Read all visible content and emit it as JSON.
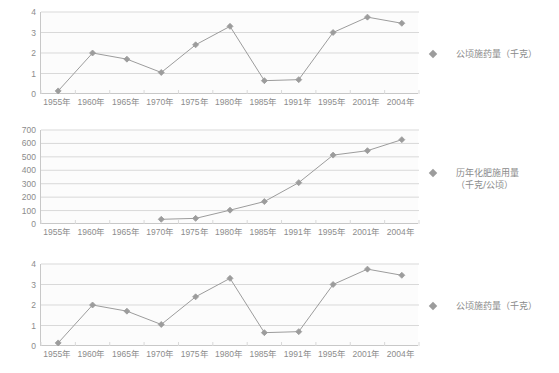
{
  "page": {
    "background": "#ffffff",
    "series_color": "#9c9c9c",
    "grid_color": "#d9d9d9",
    "axis_color": "#c8c8c8",
    "text_color": "#8c8c8c"
  },
  "charts": [
    {
      "id": "chart-top",
      "legend": {
        "label": "公顷施药量（千克）",
        "marker": "diamond-marker"
      },
      "chart_data": {
        "type": "line",
        "title": "",
        "xlabel": "",
        "ylabel": "",
        "categories": [
          "1955年",
          "1960年",
          "1965年",
          "1970年",
          "1975年",
          "1980年",
          "1985年",
          "1991年",
          "1995年",
          "2001年",
          "2004年"
        ],
        "values": [
          0.15,
          2.0,
          1.7,
          1.05,
          2.4,
          3.3,
          0.65,
          0.7,
          3.0,
          3.75,
          3.45
        ],
        "ylim": [
          0,
          4
        ],
        "yticks": [
          0,
          1,
          2,
          3,
          4
        ],
        "grid": true,
        "legend_position": "right",
        "series": [
          {
            "name": "公顷施药量（千克）",
            "values": [
              0.15,
              2.0,
              1.7,
              1.05,
              2.4,
              3.3,
              0.65,
              0.7,
              3.0,
              3.75,
              3.45
            ]
          }
        ]
      }
    },
    {
      "id": "chart-middle",
      "legend": {
        "label": "历年化肥施用量\n（千克/公顷）",
        "marker": "diamond-marker"
      },
      "chart_data": {
        "type": "line",
        "title": "",
        "xlabel": "",
        "ylabel": "",
        "categories": [
          "1955年",
          "1960年",
          "1965年",
          "1970年",
          "1975年",
          "1980年",
          "1985年",
          "1991年",
          "1995年",
          "2001年",
          "2004年"
        ],
        "values": [
          null,
          null,
          null,
          35,
          42,
          103,
          167,
          308,
          513,
          546,
          628
        ],
        "ylim": [
          0,
          700
        ],
        "yticks": [
          0,
          100,
          200,
          300,
          400,
          500,
          600,
          700
        ],
        "grid": true,
        "legend_position": "right",
        "series": [
          {
            "name": "历年化肥施用量（千克/公顷）",
            "values": [
              null,
              null,
              null,
              35,
              42,
              103,
              167,
              308,
              513,
              546,
              628
            ]
          }
        ]
      }
    },
    {
      "id": "chart-bottom",
      "legend": {
        "label": "公顷施药量（千克）",
        "marker": "diamond-marker"
      },
      "chart_data": {
        "type": "line",
        "title": "",
        "xlabel": "",
        "ylabel": "",
        "categories": [
          "1955年",
          "1960年",
          "1965年",
          "1970年",
          "1975年",
          "1980年",
          "1985年",
          "1991年",
          "1995年",
          "2001年",
          "2004年"
        ],
        "values": [
          0.15,
          2.0,
          1.7,
          1.05,
          2.4,
          3.3,
          0.65,
          0.7,
          3.0,
          3.75,
          3.45
        ],
        "ylim": [
          0,
          4
        ],
        "yticks": [
          0,
          1,
          2,
          3,
          4
        ],
        "grid": true,
        "legend_position": "right",
        "series": [
          {
            "name": "公顷施药量（千克）",
            "values": [
              0.15,
              2.0,
              1.7,
              1.05,
              2.4,
              3.3,
              0.65,
              0.7,
              3.0,
              3.75,
              3.45
            ]
          }
        ]
      }
    }
  ]
}
